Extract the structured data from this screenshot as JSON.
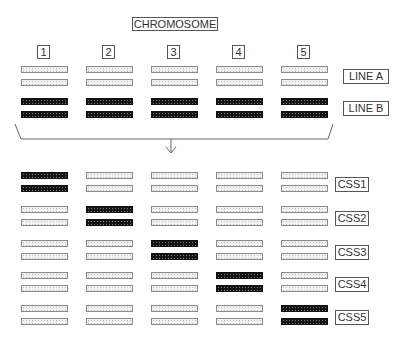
{
  "diagram": {
    "title": "CHROMOSOME",
    "chromosome_numbers": [
      "1",
      "2",
      "3",
      "4",
      "5"
    ],
    "parental_lines": [
      {
        "label": "LINE A",
        "pattern": [
          "light",
          "light",
          "light",
          "light",
          "light"
        ]
      },
      {
        "label": "LINE B",
        "pattern": [
          "dark",
          "dark",
          "dark",
          "dark",
          "dark"
        ]
      }
    ],
    "substitution_strains": [
      {
        "label": "CSS1",
        "pattern": [
          "dark",
          "light",
          "light",
          "light",
          "light"
        ]
      },
      {
        "label": "CSS2",
        "pattern": [
          "light",
          "dark",
          "light",
          "light",
          "light"
        ]
      },
      {
        "label": "CSS3",
        "pattern": [
          "light",
          "light",
          "dark",
          "light",
          "light"
        ]
      },
      {
        "label": "CSS4",
        "pattern": [
          "light",
          "light",
          "light",
          "dark",
          "light"
        ]
      },
      {
        "label": "CSS5",
        "pattern": [
          "light",
          "light",
          "light",
          "light",
          "dark"
        ]
      }
    ],
    "colors": {
      "line_a": "#f2f2f2",
      "line_b": "#141414",
      "stroke": "#555555"
    }
  }
}
